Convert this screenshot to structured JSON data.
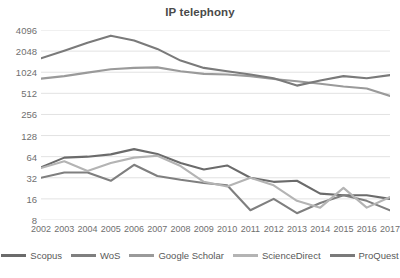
{
  "chart_data": {
    "type": "line",
    "title": "IP telephony",
    "xlabel": "",
    "ylabel": "",
    "grid": true,
    "legend_position": "bottom",
    "yscale": "log2",
    "ylim": [
      8,
      4096
    ],
    "yticks": [
      8,
      16,
      32,
      64,
      128,
      256,
      512,
      1024,
      2048,
      4096
    ],
    "categories": [
      "2002",
      "2003",
      "2004",
      "2005",
      "2006",
      "2007",
      "2008",
      "2009",
      "2010",
      "2011",
      "2012",
      "2013",
      "2014",
      "2015",
      "2016",
      "2017"
    ],
    "series": [
      {
        "name": "Scopus",
        "color": "#6b6b6b",
        "values": [
          45,
          62,
          64,
          69,
          82,
          70,
          52,
          42,
          48,
          32,
          28,
          29,
          19,
          18,
          18,
          16
        ]
      },
      {
        "name": "WoS",
        "color": "#7f7f7f",
        "values": [
          32,
          38,
          38,
          29,
          49,
          34,
          30,
          27,
          25,
          11,
          16,
          10,
          14,
          18,
          15,
          11
        ]
      },
      {
        "name": "Google Scholar",
        "color": "#9a9a9a",
        "values": [
          830,
          900,
          1010,
          1130,
          1180,
          1200,
          1060,
          970,
          950,
          900,
          820,
          760,
          700,
          640,
          600,
          470
        ]
      },
      {
        "name": "ScienceDirect",
        "color": "#b4b4b4",
        "values": [
          44,
          55,
          40,
          52,
          62,
          66,
          47,
          28,
          24,
          32,
          25,
          15,
          12,
          23,
          12,
          17
        ]
      },
      {
        "name": "ProQuest",
        "color": "#7a7a7a",
        "values": [
          1620,
          2080,
          2700,
          3400,
          2900,
          2200,
          1500,
          1180,
          1060,
          950,
          840,
          660,
          780,
          900,
          840,
          930
        ]
      }
    ]
  },
  "legend": {
    "items": [
      {
        "label": "Scopus"
      },
      {
        "label": "WoS"
      },
      {
        "label": "Google Scholar"
      },
      {
        "label": "ScienceDirect"
      },
      {
        "label": "ProQuest"
      }
    ]
  }
}
